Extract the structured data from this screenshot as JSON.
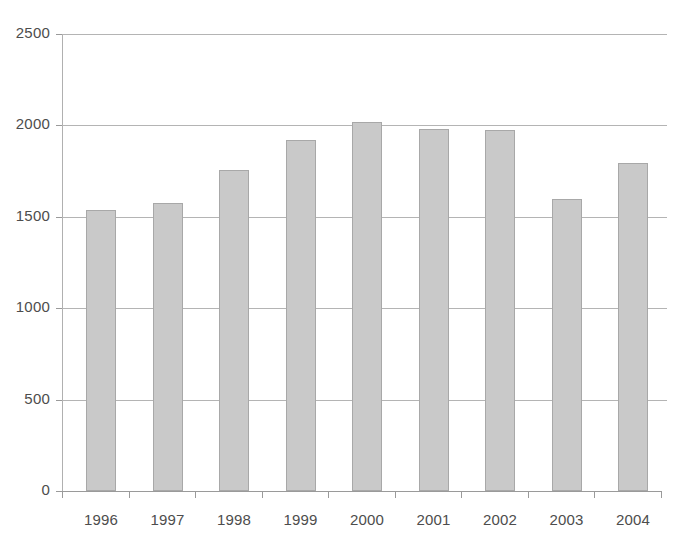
{
  "chart_data": {
    "type": "bar",
    "title": "",
    "subtitle": "",
    "xlabel": "",
    "ylabel": "",
    "categories": [
      "1996",
      "1997",
      "1998",
      "1999",
      "2000",
      "2001",
      "2002",
      "2003",
      "2004"
    ],
    "values": [
      1538,
      1577,
      1755,
      1920,
      2016,
      1980,
      1975,
      1598,
      1794
    ],
    "series": [
      {
        "name": "",
        "values": [
          1538,
          1577,
          1755,
          1920,
          2016,
          1980,
          1975,
          1598,
          1794
        ]
      }
    ],
    "ylim": [
      0,
      2500
    ],
    "ytick_values": [
      0,
      500,
      1000,
      1500,
      2000,
      2500
    ],
    "ytick_labels": [
      "0",
      "500",
      "1000",
      "1500",
      "2000",
      "2500"
    ],
    "grid": "horizontal",
    "legend": "none",
    "bar_color": "#c9c9c9",
    "bar_border_color": "#a8a8a8",
    "gridline_color": "#b4b4b4",
    "axis_color": "#9a9a9a",
    "text_color": "#4d4d4d",
    "background": "#ffffff"
  }
}
